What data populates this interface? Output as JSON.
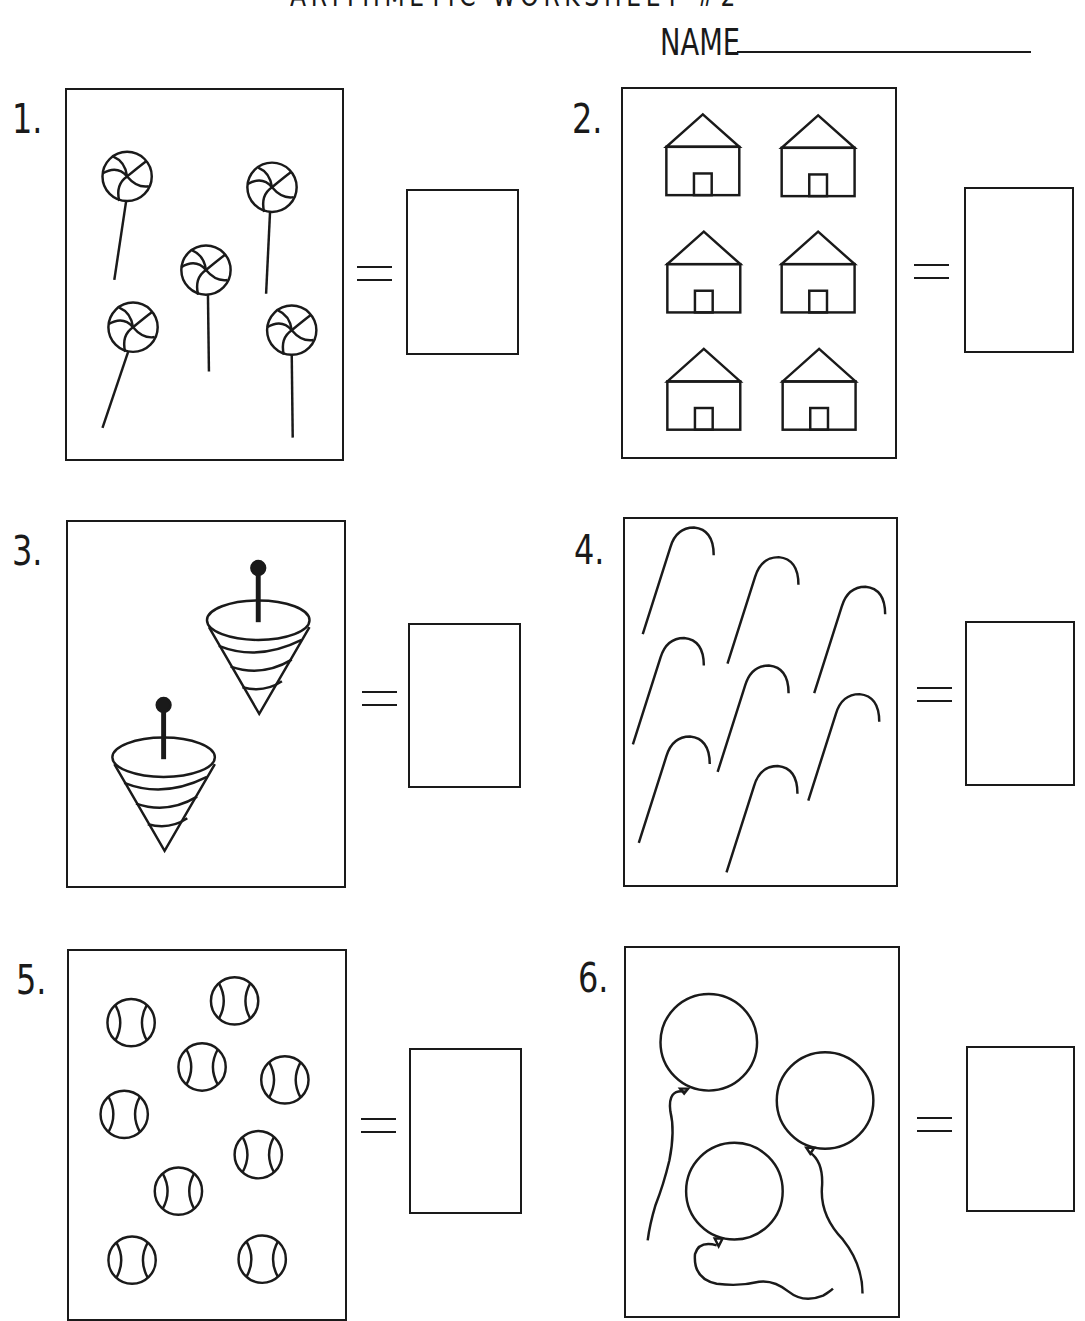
{
  "header": {
    "title": "ARITHMETIC WORKSHEET #2",
    "name_label": "NAME",
    "name_value": ""
  },
  "problems": [
    {
      "number": "1.",
      "item": "lollipop",
      "count": 5,
      "answer": ""
    },
    {
      "number": "2.",
      "item": "house",
      "count": 6,
      "answer": ""
    },
    {
      "number": "3.",
      "item": "spinning-top",
      "count": 2,
      "answer": ""
    },
    {
      "number": "4.",
      "item": "candy-cane",
      "count": 8,
      "answer": ""
    },
    {
      "number": "5.",
      "item": "ball",
      "count": 9,
      "answer": ""
    },
    {
      "number": "6.",
      "item": "balloon",
      "count": 3,
      "answer": ""
    }
  ],
  "colors": {
    "ink": "#1a1a1a",
    "paper": "#ffffff"
  }
}
